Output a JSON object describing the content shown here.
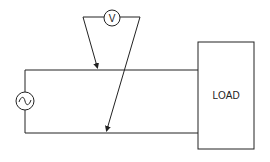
{
  "diagram": {
    "type": "circuit-schematic",
    "components": [
      {
        "id": "ac-source",
        "label": "~",
        "symbol": "ac-voltage-source"
      },
      {
        "id": "voltmeter",
        "label": "V",
        "symbol": "voltmeter"
      },
      {
        "id": "load",
        "label": "LOAD",
        "symbol": "box"
      }
    ],
    "connections": [
      "ac-source top -> top wire -> load",
      "ac-source bottom -> bottom wire -> load",
      "voltmeter left probe -> top wire",
      "voltmeter right probe -> bottom wire (crossing top wire)"
    ]
  },
  "voltmeter": {
    "label": "V"
  },
  "source": {
    "label": "~"
  },
  "load": {
    "label": "LOAD"
  },
  "colors": {
    "stroke": "#222222",
    "background": "#ffffff"
  }
}
